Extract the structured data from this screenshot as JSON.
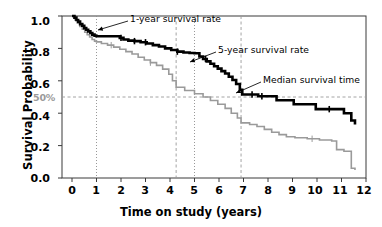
{
  "figure": {
    "kind": "kaplan-meier-survival-plot",
    "background": "#ffffff"
  },
  "axes": {
    "xlabel": "Time on study (years)",
    "ylabel": "Survival Probability",
    "x_ticks": [
      "0",
      "1",
      "2",
      "3",
      "4",
      "5",
      "6",
      "7",
      "8",
      "9",
      "10",
      "11",
      "12"
    ],
    "y_ticks": [
      "0.0",
      "0.2",
      "0.4",
      "0.6",
      "0.8",
      "1.0"
    ],
    "median_label": "50%"
  },
  "annotations": [
    {
      "key": "one_year",
      "text": "1-year survival rate"
    },
    {
      "key": "five_year",
      "text": "5-year survival rate"
    },
    {
      "key": "median",
      "text": "Median survival time"
    }
  ],
  "chart_data": {
    "type": "line",
    "title": "",
    "xlabel": "Time on study (years)",
    "ylabel": "Survival Probability",
    "xlim": [
      0,
      12
    ],
    "ylim": [
      0.0,
      1.0
    ],
    "x_ticks": [
      0,
      1,
      2,
      3,
      4,
      5,
      6,
      7,
      8,
      9,
      10,
      11,
      12
    ],
    "y_ticks": [
      0.0,
      0.2,
      0.4,
      0.6,
      0.8,
      1.0
    ],
    "grid": false,
    "legend": "none",
    "reference_lines": {
      "horizontal": [
        {
          "y": 0.5,
          "label": "50%",
          "style": "dashed",
          "color": "#9a9a9a"
        }
      ],
      "vertical": [
        {
          "x": 1.0,
          "style": "dotted",
          "color": "#8c8c8c",
          "note": "1-year survival rate"
        },
        {
          "x": 5.0,
          "style": "dotted",
          "color": "#8c8c8c",
          "note": "5-year survival rate"
        },
        {
          "x": 4.25,
          "style": "dashed",
          "color": "#9a9a9a",
          "note": "median survival time, lower curve"
        },
        {
          "x": 6.9,
          "style": "dashed",
          "color": "#9a9a9a",
          "note": "median survival time, upper curve"
        }
      ]
    },
    "series": [
      {
        "name": "upper-curve",
        "color": "#000000",
        "linewidth": 2.6,
        "step": "post",
        "censor_marks_x": [
          2.0,
          2.55,
          3.0,
          4.3,
          5.45,
          7.35,
          7.75,
          10.5
        ],
        "x": [
          0.0,
          0.1,
          0.18,
          0.25,
          0.33,
          0.42,
          0.5,
          0.58,
          0.66,
          0.75,
          0.83,
          0.92,
          1.0,
          1.5,
          1.95,
          2.1,
          2.3,
          2.55,
          2.8,
          3.05,
          3.3,
          3.55,
          3.8,
          4.05,
          4.3,
          4.55,
          4.8,
          5.0,
          5.2,
          5.35,
          5.5,
          5.65,
          5.8,
          5.95,
          6.1,
          6.25,
          6.4,
          6.55,
          6.7,
          6.85,
          6.95,
          7.6,
          8.35,
          9.05,
          9.95,
          11.1,
          11.4,
          11.55
        ],
        "y": [
          1.0,
          0.99,
          0.975,
          0.965,
          0.95,
          0.94,
          0.925,
          0.915,
          0.905,
          0.895,
          0.885,
          0.878,
          0.875,
          0.875,
          0.865,
          0.855,
          0.848,
          0.845,
          0.838,
          0.83,
          0.82,
          0.812,
          0.8,
          0.79,
          0.78,
          0.775,
          0.772,
          0.77,
          0.75,
          0.735,
          0.72,
          0.705,
          0.69,
          0.675,
          0.66,
          0.645,
          0.625,
          0.605,
          0.58,
          0.545,
          0.515,
          0.505,
          0.48,
          0.455,
          0.425,
          0.4,
          0.355,
          0.33
        ]
      },
      {
        "name": "lower-curve",
        "color": "#9a9a9a",
        "linewidth": 1.6,
        "step": "post",
        "censor_marks_x": [
          1.6,
          3.2,
          9.8
        ],
        "x": [
          0.0,
          0.12,
          0.22,
          0.32,
          0.42,
          0.52,
          0.62,
          0.72,
          0.82,
          0.92,
          1.0,
          1.2,
          1.45,
          1.7,
          1.95,
          2.2,
          2.45,
          2.7,
          2.95,
          3.2,
          3.45,
          3.7,
          3.95,
          4.1,
          4.25,
          4.6,
          5.0,
          5.35,
          5.65,
          5.95,
          6.25,
          6.5,
          6.75,
          6.9,
          7.25,
          7.55,
          7.85,
          8.15,
          8.45,
          8.75,
          9.1,
          9.6,
          10.1,
          10.6,
          10.8,
          11.1,
          11.4,
          11.55
        ],
        "y": [
          1.0,
          0.975,
          0.955,
          0.935,
          0.918,
          0.9,
          0.885,
          0.87,
          0.855,
          0.845,
          0.84,
          0.83,
          0.82,
          0.808,
          0.795,
          0.78,
          0.765,
          0.745,
          0.728,
          0.712,
          0.695,
          0.672,
          0.64,
          0.6,
          0.56,
          0.54,
          0.52,
          0.5,
          0.478,
          0.455,
          0.43,
          0.4,
          0.37,
          0.34,
          0.33,
          0.318,
          0.3,
          0.282,
          0.268,
          0.255,
          0.248,
          0.242,
          0.235,
          0.228,
          0.175,
          0.165,
          0.06,
          0.05
        ]
      }
    ]
  },
  "geometry": {
    "plot_left": 62,
    "plot_right": 366,
    "plot_top": 16,
    "plot_bottom": 178,
    "x0_px": 72,
    "x_per_unit": 24.5
  }
}
